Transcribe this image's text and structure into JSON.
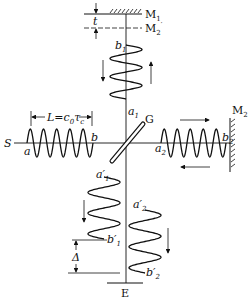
{
  "diagram": {
    "labels": {
      "mirror1": "M",
      "mirror1_sub": "1",
      "mirror2_image": "M",
      "mirror2_image_sub": "2",
      "mirror2_image_prime": "′",
      "mirror2": "M",
      "mirror2_sub": "2",
      "thickness": "t",
      "source": "S",
      "beamsplitter": "G",
      "detector": "E",
      "coherence_length": "L=c",
      "coherence_length_sub0": "0",
      "coherence_length_tau": "τ",
      "coherence_length_subc": "c",
      "delta": "Δ",
      "a": "a",
      "b": "b",
      "a1": "a",
      "a1_sub": "1",
      "b1": "b",
      "b1_sub": "1",
      "a2": "a",
      "a2_sub": "2",
      "b2": "b",
      "b2_sub": "2",
      "a1p": "a′",
      "a1p_sub": "1",
      "b1p": "b′",
      "b1p_sub": "1",
      "a2p": "a′",
      "a2p_sub": "2",
      "b2p": "b′",
      "b2p_sub": "2"
    },
    "wave_trains": [
      {
        "name": "source-train",
        "periods": 5,
        "direction": "horizontal"
      },
      {
        "name": "arm1-train",
        "periods": 3,
        "direction": "vertical"
      },
      {
        "name": "arm2-train",
        "periods": 5,
        "direction": "horizontal"
      },
      {
        "name": "output1-train",
        "periods": 3,
        "direction": "vertical"
      },
      {
        "name": "output2-train",
        "periods": 3,
        "direction": "vertical"
      }
    ],
    "colors": {
      "ink": "#111111",
      "background": "#ffffff"
    }
  }
}
